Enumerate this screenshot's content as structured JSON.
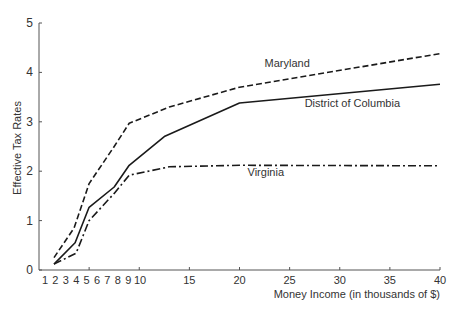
{
  "chart_data": {
    "type": "line",
    "title": "",
    "xlabel": "Money Income (in thousands of $)",
    "ylabel": "Effective Tax Rates",
    "xlim": [
      0,
      40
    ],
    "ylim": [
      0,
      5
    ],
    "grid": false,
    "legend": "inline labels",
    "x_ticks": [
      5,
      10,
      15,
      20,
      25,
      30,
      35,
      40
    ],
    "x_tick_labels": [
      "1",
      "2",
      "3",
      "4",
      "5",
      "6",
      "7",
      "8",
      "9",
      "10",
      "15",
      "20",
      "25",
      "30",
      "35",
      "40"
    ],
    "x_tick_label_values": [
      1,
      2,
      3,
      4,
      5,
      6,
      7,
      8,
      9,
      10,
      15,
      20,
      25,
      30,
      35,
      40
    ],
    "y_ticks": [
      0,
      1,
      2,
      3,
      4,
      5
    ],
    "y_tick_labels": [
      "0",
      "1",
      "2",
      "3",
      "4",
      "5"
    ],
    "series": [
      {
        "name": "Maryland",
        "style": "dashed",
        "x": [
          1.5,
          3.5,
          5,
          7.5,
          9,
          13,
          20,
          40
        ],
        "values": [
          0.25,
          0.85,
          1.75,
          2.5,
          2.97,
          3.3,
          3.7,
          4.38
        ],
        "label_pos": [
          22.5,
          4.1
        ]
      },
      {
        "name": "District of Columbia",
        "style": "solid",
        "x": [
          1.5,
          3.6,
          5,
          7.5,
          9,
          12.5,
          20,
          40
        ],
        "values": [
          0.12,
          0.55,
          1.27,
          1.68,
          2.12,
          2.7,
          3.38,
          3.76
        ],
        "label_pos": [
          26.5,
          3.3
        ]
      },
      {
        "name": "Virginia",
        "style": "dashdot",
        "x": [
          1.5,
          3.7,
          5,
          7.5,
          9,
          13,
          20,
          40
        ],
        "values": [
          0.12,
          0.34,
          1.0,
          1.55,
          1.92,
          2.09,
          2.12,
          2.11
        ],
        "label_pos": [
          20.8,
          1.9
        ]
      }
    ]
  }
}
